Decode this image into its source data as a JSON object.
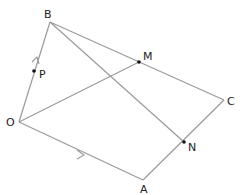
{
  "diagram": {
    "type": "geometry",
    "line_color": "#9a9a9a",
    "label_color": "#222222",
    "point_color": "#111111",
    "points": {
      "O": {
        "label": "O",
        "x": 19,
        "y": 122
      },
      "B": {
        "label": "B",
        "x": 50,
        "y": 22
      },
      "A": {
        "label": "A",
        "x": 143,
        "y": 180
      },
      "C": {
        "label": "C",
        "x": 224,
        "y": 100
      },
      "M": {
        "label": "M",
        "x": 139,
        "y": 62
      },
      "N": {
        "label": "N",
        "x": 184,
        "y": 142
      },
      "P": {
        "label": "P",
        "x": 34,
        "y": 71
      }
    },
    "segments": [
      {
        "from": "O",
        "to": "B",
        "arrow": true
      },
      {
        "from": "O",
        "to": "A",
        "arrow": true
      },
      {
        "from": "B",
        "to": "C",
        "arrow": false
      },
      {
        "from": "A",
        "to": "C",
        "arrow": false
      },
      {
        "from": "O",
        "to": "M",
        "arrow": false
      },
      {
        "from": "B",
        "to": "N",
        "arrow": false
      }
    ],
    "marked_points": [
      "M",
      "N",
      "P"
    ]
  }
}
